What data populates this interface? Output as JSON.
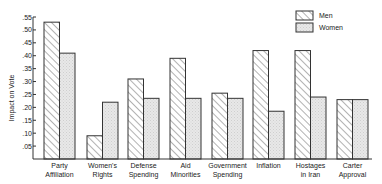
{
  "chart_data": {
    "type": "bar",
    "title": "",
    "xlabel": "",
    "ylabel": "Impact on Vote",
    "ylim": [
      0,
      0.55
    ],
    "yticks": [
      ".05",
      ".10",
      ".15",
      ".20",
      ".25",
      ".30",
      ".35",
      ".40",
      ".45",
      ".50",
      ".55"
    ],
    "grid": false,
    "legend_position": "top-right",
    "categories": [
      [
        "Party",
        "Affiliation"
      ],
      [
        "Women's",
        "Rights"
      ],
      [
        "Defense",
        "Spending"
      ],
      [
        "Aid",
        "Minorities"
      ],
      [
        "Government",
        "Spending"
      ],
      [
        "Inflation"
      ],
      [
        "Hostages",
        "in Iran"
      ],
      [
        "Carter",
        "Approval"
      ]
    ],
    "series": [
      {
        "name": "Men",
        "pattern": "diagonal-hatch",
        "values": [
          0.53,
          0.09,
          0.31,
          0.39,
          0.255,
          0.42,
          0.42,
          0.23
        ]
      },
      {
        "name": "Women",
        "pattern": "light-stipple",
        "values": [
          0.41,
          0.22,
          0.235,
          0.235,
          0.235,
          0.185,
          0.24,
          0.23
        ]
      }
    ]
  },
  "colors": {
    "axis": "#333333",
    "bar_stroke": "#333333",
    "women_fill": "#e6e6e6",
    "hatch": "#555555",
    "text": "#222222"
  }
}
